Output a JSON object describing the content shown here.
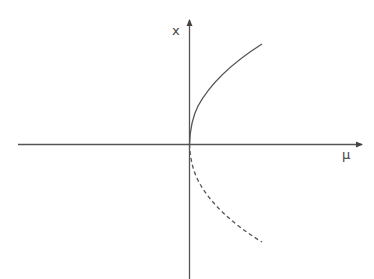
{
  "diagram": {
    "type": "bifurcation-diagram",
    "axes": {
      "horizontal_label": "μ",
      "vertical_label": "x"
    },
    "branches": [
      {
        "name": "stable-branch",
        "style": "solid",
        "shape": "x = +sqrt(μ)"
      },
      {
        "name": "unstable-branch",
        "style": "dashed",
        "shape": "x = -sqrt(μ)"
      }
    ],
    "colors": {
      "axis": "#555555",
      "curve": "#555555",
      "background": "#ffffff"
    }
  }
}
